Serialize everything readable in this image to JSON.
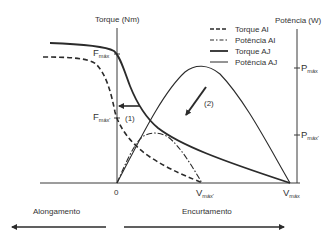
{
  "diagram": {
    "type": "torque-power-velocity curves",
    "axes": {
      "left_axis_label": "Torque (Nm)",
      "right_axis_label": "Potência (W)",
      "origin_label": "0",
      "vmax_label_main": "V",
      "vmax_label_sub": "máx",
      "vmax_prime_label_main": "V",
      "vmax_prime_label_sub": "máx'",
      "fmax_label_main": "F",
      "fmax_label_sub": "máx",
      "fmax_prime_label_main": "F",
      "fmax_prime_label_sub": "máx'",
      "pmax_label_main": "P",
      "pmax_label_sub": "máx",
      "pmax_prime_label_main": "P",
      "pmax_prime_label_sub": "máx'"
    },
    "legend": [
      {
        "style": "dashed",
        "label": "Torque AI"
      },
      {
        "style": "dash-dot",
        "label": "Potência AI"
      },
      {
        "style": "thick-solid",
        "label": "Torque AJ"
      },
      {
        "style": "thin-solid",
        "label": "Potência AJ"
      }
    ],
    "annotations": {
      "arrow1_label": "(1)",
      "arrow2_label": "(2)"
    },
    "direction": {
      "left_label": "Alongamento",
      "right_label": "Encurtamento"
    },
    "colors": {
      "line": "#2b2b2b",
      "axis": "#3a3a3a",
      "text": "#333333"
    }
  }
}
